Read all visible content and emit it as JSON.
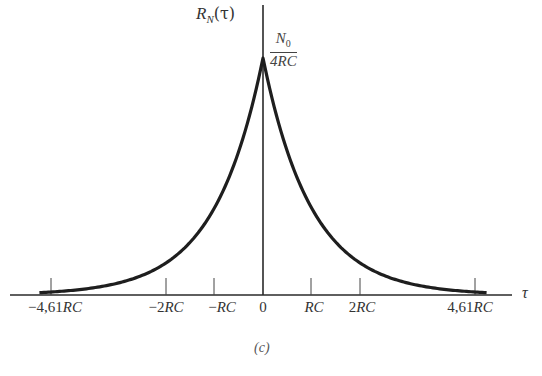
{
  "chart_data": {
    "type": "line",
    "title": "",
    "caption": "(c)",
    "ylabel": "R_N(τ)",
    "xlabel": "τ",
    "peak_label": {
      "numerator": "N₀",
      "denominator": "4RC"
    },
    "function": "R_N(τ) = (N0/(4RC)) · exp(-|τ|/RC)",
    "x_unit": "RC",
    "x_range": [
      -4.61,
      4.61
    ],
    "tick_labels": [
      "−4,61RC",
      "−2RC",
      "−RC",
      "0",
      "RC",
      "2RC",
      "4,61RC"
    ],
    "tick_positions": [
      -4.61,
      -2,
      -1,
      0,
      1,
      2,
      4.61
    ],
    "x": [
      -4.61,
      -4,
      -3,
      -2,
      -1,
      -0.5,
      0,
      0.5,
      1,
      2,
      3,
      4,
      4.61
    ],
    "y_normalized": [
      0.01,
      0.018,
      0.05,
      0.135,
      0.368,
      0.607,
      1.0,
      0.607,
      0.368,
      0.135,
      0.05,
      0.018,
      0.01
    ],
    "peak_value": "N0/(4RC)",
    "grid": false,
    "legend": null
  },
  "labels": {
    "y_axis_main": "R",
    "y_axis_sub": "N",
    "y_axis_arg": "(τ)",
    "x_axis": "τ",
    "frac_num": "N",
    "frac_num_sub": "0",
    "frac_den": "4RC",
    "caption": "(c)",
    "ticks": {
      "t0": "−4,61",
      "t0u": "RC",
      "t1": "−2",
      "t1u": "RC",
      "t2": "−",
      "t2u": "RC",
      "t3": "0",
      "t4u": "RC",
      "t5": "2",
      "t5u": "RC",
      "t6": "4,61",
      "t6u": "RC"
    }
  }
}
